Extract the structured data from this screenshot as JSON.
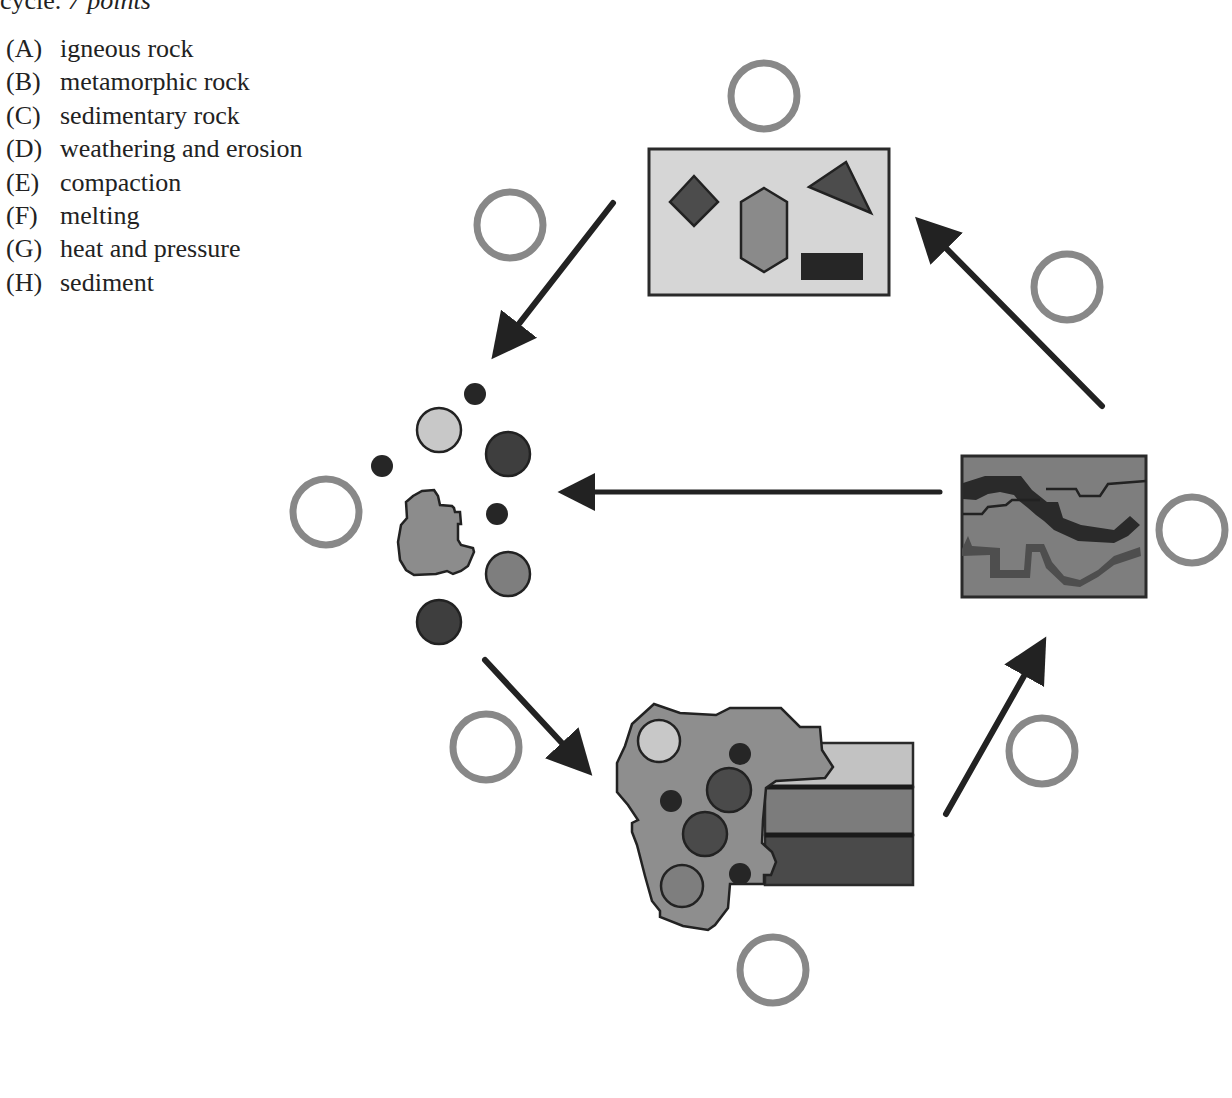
{
  "header": {
    "prefix": "cycle.",
    "points": "7 points"
  },
  "options": [
    {
      "letter": "(A)",
      "label": "igneous rock"
    },
    {
      "letter": "(B)",
      "label": "metamorphic rock"
    },
    {
      "letter": "(C)",
      "label": "sedimentary rock"
    },
    {
      "letter": "(D)",
      "label": "weathering and erosion"
    },
    {
      "letter": "(E)",
      "label": "compaction"
    },
    {
      "letter": "(F)",
      "label": "melting"
    },
    {
      "letter": "(G)",
      "label": "heat and pressure"
    },
    {
      "letter": "(H)",
      "label": "sediment"
    }
  ],
  "diagram": {
    "colors": {
      "answer_circle": "#888888",
      "arrow": "#222222",
      "outline": "#222222",
      "light_gray": "#d4d4d4",
      "mid_gray": "#8c8c8c",
      "dark_gray": "#4a4a4a",
      "darkest": "#1e1e1e"
    },
    "nodes": [
      {
        "id": "igneous-rock-box",
        "depicts": "crystals (diamond, hexagon, triangle, rectangle) in light gray box"
      },
      {
        "id": "sediment-pile",
        "depicts": "scattered pebbles and rock fragment"
      },
      {
        "id": "sedimentary-rock",
        "depicts": "conglomerate rock with layered strata"
      },
      {
        "id": "metamorphic-rock-box",
        "depicts": "folded bands in dark gray box"
      }
    ],
    "answer_blanks": [
      {
        "id": "blank-igneous",
        "value": ""
      },
      {
        "id": "blank-top-left-arrow",
        "value": ""
      },
      {
        "id": "blank-top-right-arrow",
        "value": ""
      },
      {
        "id": "blank-sediment",
        "value": ""
      },
      {
        "id": "blank-metamorphic",
        "value": ""
      },
      {
        "id": "blank-bottom-left-arrow",
        "value": ""
      },
      {
        "id": "blank-bottom-right-arrow",
        "value": ""
      },
      {
        "id": "blank-sedimentary",
        "value": ""
      }
    ],
    "arrows": [
      {
        "from": "igneous-rock-box",
        "to": "sediment-pile"
      },
      {
        "from": "sediment-pile",
        "to": "sedimentary-rock"
      },
      {
        "from": "sedimentary-rock",
        "to": "metamorphic-rock-box"
      },
      {
        "from": "metamorphic-rock-box",
        "to": "igneous-rock-box"
      },
      {
        "from": "metamorphic-rock-box",
        "to": "sediment-pile"
      }
    ]
  }
}
